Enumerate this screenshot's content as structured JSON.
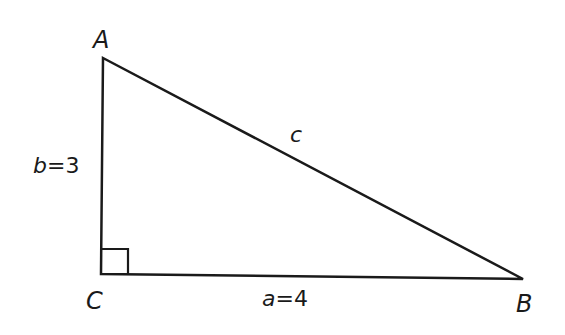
{
  "diagram": {
    "type": "right-triangle",
    "stroke_color": "#1a1a1a",
    "background": "#ffffff",
    "vertices": {
      "A": {
        "label": "A",
        "x": 103,
        "y": 58
      },
      "B": {
        "label": "B",
        "x": 523,
        "y": 279
      },
      "C": {
        "label": "C",
        "x": 101,
        "y": 274
      }
    },
    "right_angle_at": "C",
    "sides": {
      "a": {
        "var": "a",
        "eq": "=",
        "value": "4",
        "between": [
          "C",
          "B"
        ]
      },
      "b": {
        "var": "b",
        "eq": "=",
        "value": "3",
        "between": [
          "A",
          "C"
        ]
      },
      "c": {
        "var": "c",
        "between": [
          "A",
          "B"
        ]
      }
    }
  }
}
